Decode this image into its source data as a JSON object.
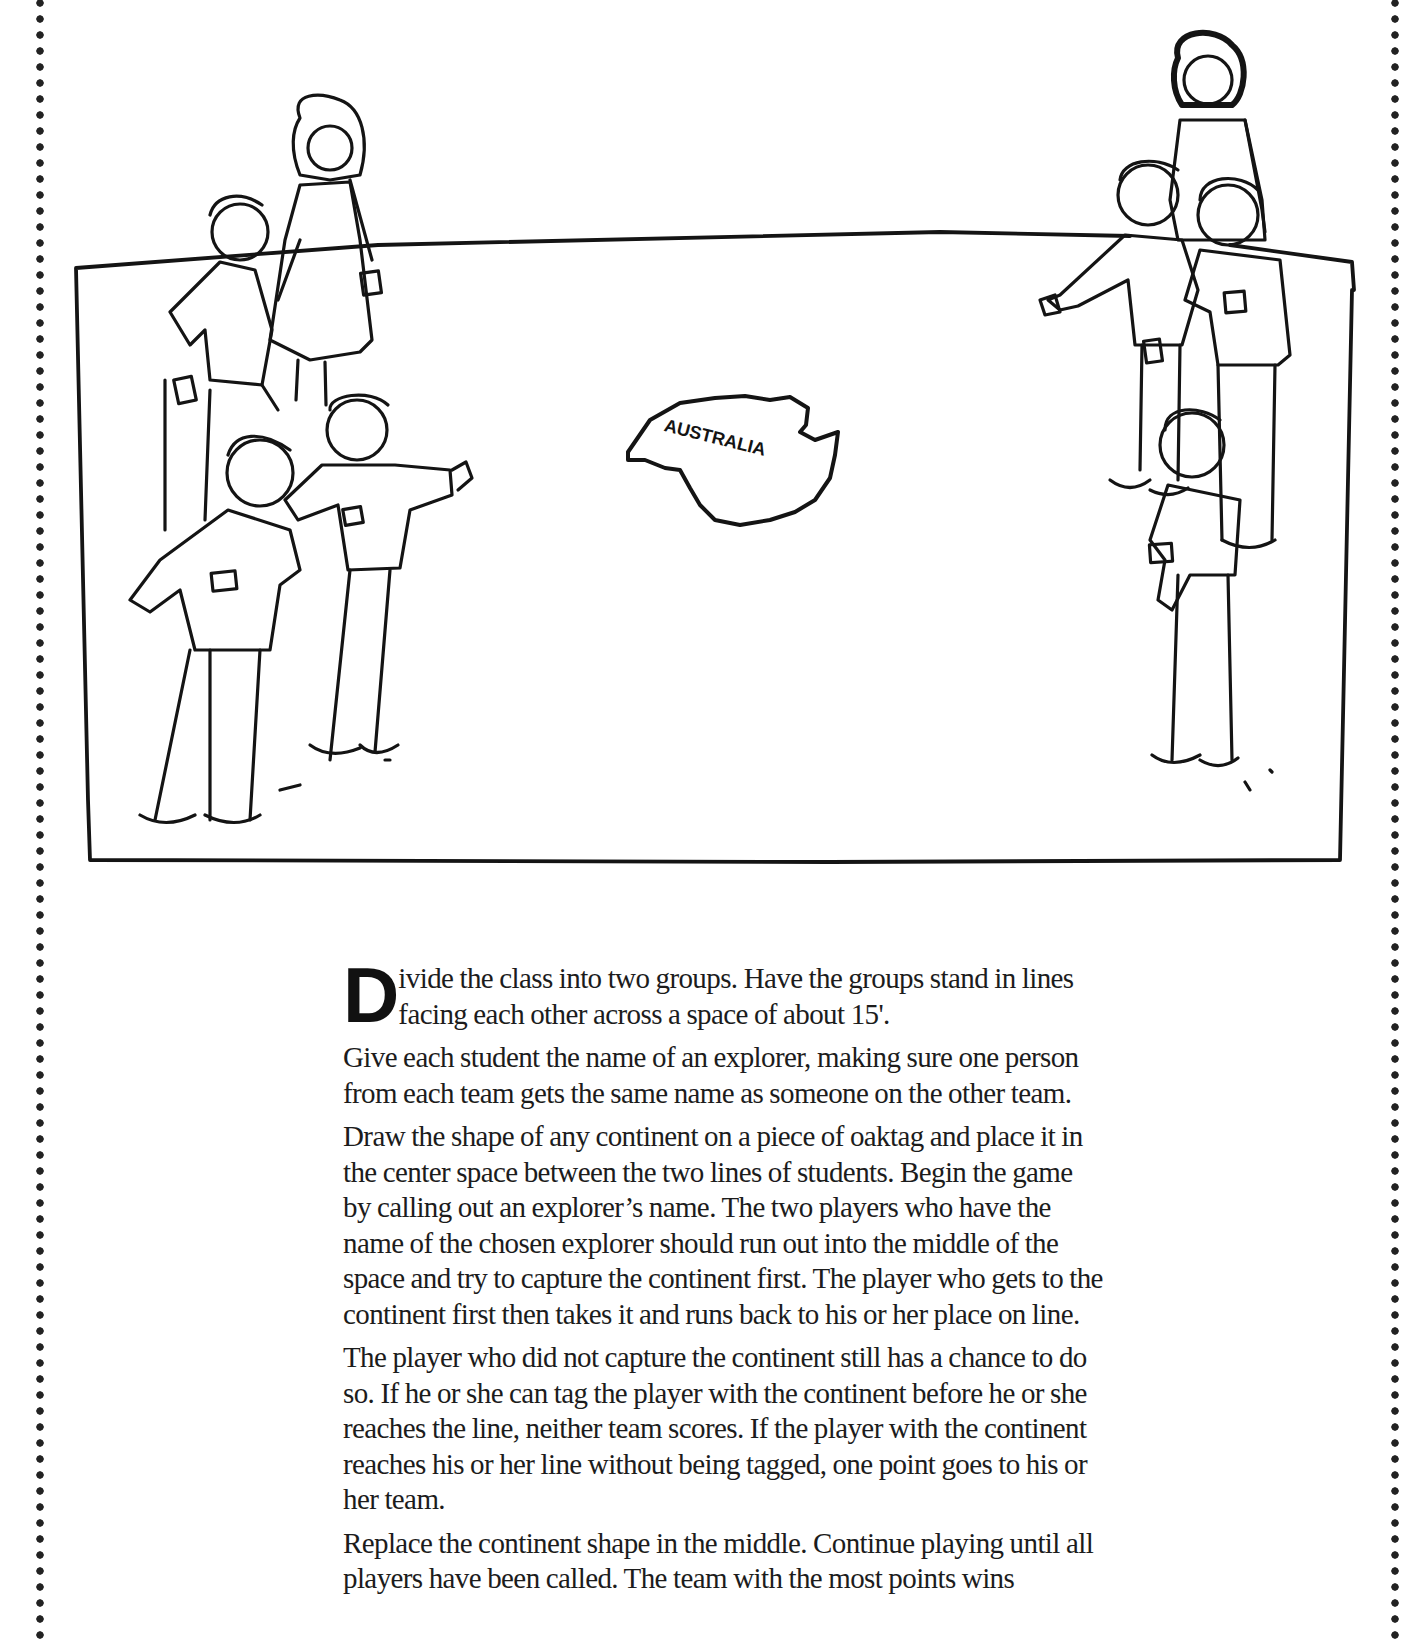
{
  "page": {
    "border_style": "dotted",
    "ink_color": "#1a1a1a",
    "background": "#ffffff"
  },
  "illustration": {
    "description": "Two lines of children facing each other across a rectangular playing field with a continent cutout in the center",
    "continent_label": "AUSTRALIA",
    "left_team_count": 5,
    "right_team_count": 5
  },
  "instructions": {
    "drop_cap": "D",
    "paragraphs": [
      "ivide the class into two groups.  Have the groups stand in lines facing each other across a space of about 15'.",
      "Give each student the name of an explorer, making sure one person from each team gets the same name as someone on the other team.",
      "Draw the shape of any continent on a piece of oaktag and place it in the center space between the two lines of students.  Begin the game by calling out an explorer’s name.  The two players who have the name of the chosen explorer should run out into the middle of the space and try to capture the continent first.  The player who gets to the continent first then takes it and runs back to his or her place on line.",
      "The player who did not capture the continent still has a chance to do so.  If he or she can tag the player with the continent before he or she reaches the line, neither team scores.  If the player with the continent reaches his or her line without being tagged, one point goes to his or her team.",
      "Replace the continent shape in the middle.  Continue playing until all players have been called.  The team with the most points wins"
    ]
  }
}
